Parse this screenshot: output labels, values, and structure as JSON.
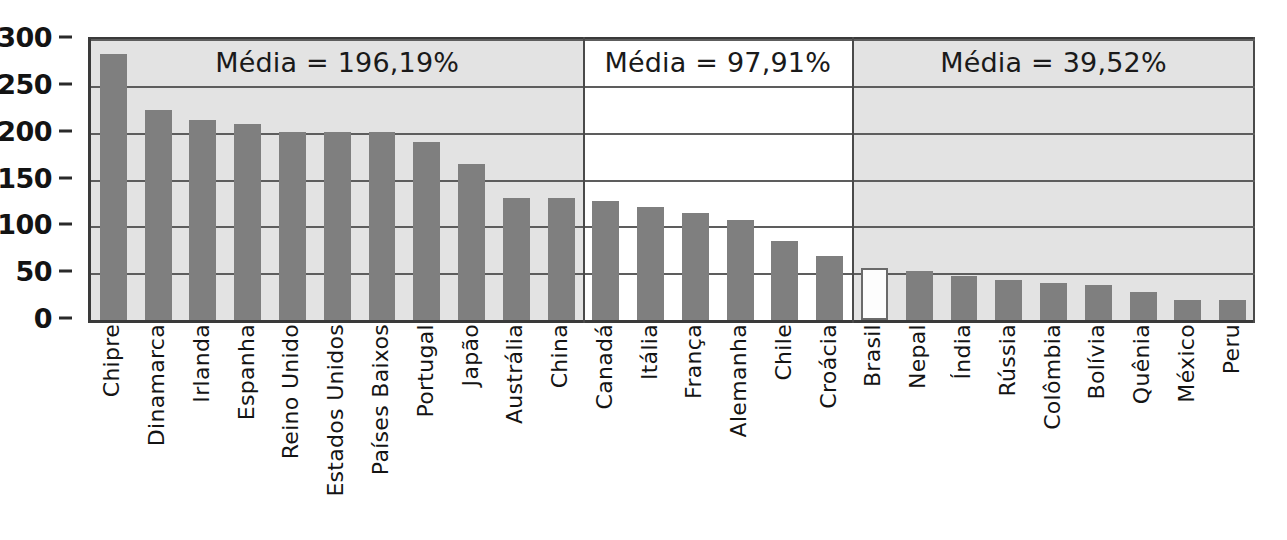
{
  "chart_data": {
    "type": "bar",
    "title": "",
    "subtitle": "",
    "xlabel": "",
    "ylabel": "",
    "ylim": [
      0,
      300
    ],
    "yticks": [
      0,
      50,
      100,
      150,
      200,
      250,
      300
    ],
    "ytick_labels": [
      "0",
      "50",
      "100",
      "150",
      "200",
      "250",
      "300"
    ],
    "grid": true,
    "legend": "none",
    "categories": [
      "Chipre",
      "Dinamarca",
      "Irlanda",
      "Espanha",
      "Reino Unido",
      "Estados Unidos",
      "Países Baixos",
      "Portugal",
      "Japão",
      "Austrália",
      "China",
      "Canadá",
      "Itália",
      "França",
      "Alemanha",
      "Chile",
      "Croácia",
      "Brasil",
      "Nepal",
      "Índia",
      "Rússia",
      "Colômbia",
      "Bolívia",
      "Quênia",
      "México",
      "Peru"
    ],
    "values": [
      284,
      224,
      214,
      209,
      201,
      201,
      201,
      190,
      167,
      130,
      130,
      127,
      121,
      114,
      107,
      84,
      68,
      55,
      52,
      47,
      43,
      40,
      37,
      30,
      21,
      21
    ],
    "highlighted_category": "Brasil",
    "panels": [
      {
        "label": "Média = 196,19%",
        "mean": 196.19,
        "first_index": 0,
        "last_index": 10,
        "background": "#e3e3e3"
      },
      {
        "label": "Média = 97,91%",
        "mean": 97.91,
        "first_index": 11,
        "last_index": 16,
        "background": "#ffffff"
      },
      {
        "label": "Média = 39,52%",
        "mean": 39.52,
        "first_index": 17,
        "last_index": 25,
        "background": "#e3e3e3"
      }
    ],
    "colors": {
      "bar": "#7f7f7f",
      "bar_highlight": "#fdfdfd",
      "axis": "#3a3a3a",
      "gridline": "#5d5d5d",
      "panel_shaded": "#e3e3e3",
      "panel_plain": "#ffffff",
      "text": "#141414"
    }
  }
}
